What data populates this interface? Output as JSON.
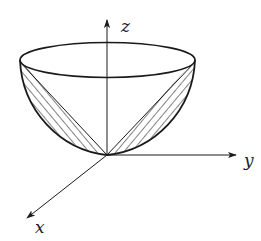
{
  "figure": {
    "axes": {
      "x": {
        "label": "x"
      },
      "y": {
        "label": "y"
      },
      "z": {
        "label": "z"
      }
    },
    "colors": {
      "stroke": "#1a1a1a",
      "background": "#ffffff"
    }
  }
}
